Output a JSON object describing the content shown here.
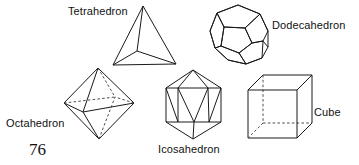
{
  "figure": {
    "topic": "The five Platonic solids",
    "page_number": "76",
    "stroke_color": "#1a1a1a",
    "hidden_stroke_color": "#3a3a3a",
    "background_color": "#ffffff",
    "labels": {
      "tetrahedron": "Tetrahedron",
      "dodecahedron": "Dodecahedron",
      "octahedron": "Octahedron",
      "icosahedron": "Icosahedron",
      "cube": "Cube"
    },
    "solids": [
      {
        "name": "tetrahedron",
        "label": "Tetrahedron",
        "faces": 4,
        "label_position": "upper-left-of-shape"
      },
      {
        "name": "dodecahedron",
        "label": "Dodecahedron",
        "faces": 12,
        "label_position": "right-of-shape"
      },
      {
        "name": "octahedron",
        "label": "Octahedron",
        "faces": 8,
        "label_position": "lower-left-of-shape"
      },
      {
        "name": "icosahedron",
        "label": "Icosahedron",
        "faces": 20,
        "label_position": "below-shape"
      },
      {
        "name": "cube",
        "label": "Cube",
        "faces": 6,
        "label_position": "right-of-shape"
      }
    ]
  }
}
